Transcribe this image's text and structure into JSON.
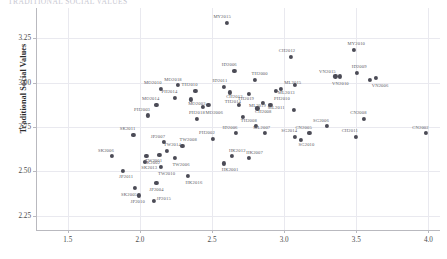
{
  "title_clipped": "TRADITIONAL SOCIAL VALUES",
  "axes": {
    "ylabel": "Traditional Social Values",
    "xlabel": "",
    "xticks": [
      "1.5",
      "2.0",
      "2.5",
      "3.0",
      "3.5",
      "4.0"
    ],
    "yticks": [
      "2.25",
      "2.50",
      "2.75",
      "3.00",
      "3.25"
    ]
  },
  "colors": {
    "marker": "#4b4b56",
    "grid": "#e9e9ef",
    "axis": "#b9b9bf"
  },
  "chart_data": {
    "type": "scatter",
    "title": "",
    "xlabel": "",
    "ylabel": "Traditional Social Values",
    "xlim": [
      1.28,
      4.08
    ],
    "ylim": [
      2.17,
      3.42
    ],
    "xticks": [
      1.5,
      2.0,
      2.5,
      3.0,
      3.5,
      4.0
    ],
    "yticks": [
      2.25,
      2.5,
      2.75,
      3.0,
      3.25
    ],
    "grid": true,
    "legend": "none",
    "points": [
      {
        "label": "MY2015",
        "x": 2.605,
        "y": 3.335
      },
      {
        "label": "MY2010",
        "x": 3.485,
        "y": 3.185
      },
      {
        "label": "CH2012",
        "x": 3.045,
        "y": 3.145
      },
      {
        "label": "ID2006",
        "x": 2.655,
        "y": 3.065
      },
      {
        "label": "VN2015",
        "x": 3.355,
        "y": 3.035
      },
      {
        "label": "VN2010",
        "x": 3.385,
        "y": 3.035
      },
      {
        "label": "ID2009",
        "x": 3.505,
        "y": 3.055
      },
      {
        "label": "TH2000",
        "x": 2.795,
        "y": 3.015
      },
      {
        "label": "ML2011",
        "x": 3.075,
        "y": 2.985
      },
      {
        "label": "VN2006",
        "x": 3.595,
        "y": 3.015
      },
      {
        "label": "VN2001",
        "x": 3.635,
        "y": 3.025
      },
      {
        "label": "MO2018",
        "x": 2.265,
        "y": 2.985
      },
      {
        "label": "ID2011",
        "x": 2.585,
        "y": 2.975
      },
      {
        "label": "MO2010",
        "x": 2.145,
        "y": 2.965
      },
      {
        "label": "TH2010",
        "x": 2.385,
        "y": 2.955
      },
      {
        "label": "CH2013",
        "x": 2.625,
        "y": 2.945
      },
      {
        "label": "TH2019",
        "x": 2.755,
        "y": 2.935
      },
      {
        "label": "PH2010",
        "x": 2.945,
        "y": 2.955
      },
      {
        "label": "ML2015",
        "x": 2.975,
        "y": 2.965
      },
      {
        "label": "PH2014",
        "x": 2.245,
        "y": 2.915
      },
      {
        "label": "MO2003",
        "x": 2.355,
        "y": 2.905
      },
      {
        "label": "MO2014",
        "x": 2.115,
        "y": 2.875
      },
      {
        "label": "ML2019",
        "x": 2.855,
        "y": 2.885
      },
      {
        "label": "TH2014",
        "x": 2.685,
        "y": 2.875
      },
      {
        "label": "PH2003",
        "x": 2.055,
        "y": 2.815
      },
      {
        "label": "ML2011b",
        "x": 2.905,
        "y": 2.875
      },
      {
        "label": "CH2008",
        "x": 2.815,
        "y": 2.855
      },
      {
        "label": "MO2006",
        "x": 2.475,
        "y": 2.875
      },
      {
        "label": "PH2018",
        "x": 2.435,
        "y": 2.865
      },
      {
        "label": "ML2013",
        "x": 3.065,
        "y": 2.845
      },
      {
        "label": "PH2010b",
        "x": 2.395,
        "y": 2.795
      },
      {
        "label": "TH2008",
        "x": 2.715,
        "y": 2.805
      },
      {
        "label": "CN2008",
        "x": 3.555,
        "y": 2.795
      },
      {
        "label": "SG2006",
        "x": 3.295,
        "y": 2.755
      },
      {
        "label": "ML2007",
        "x": 2.805,
        "y": 2.755
      },
      {
        "label": "SK2011",
        "x": 1.955,
        "y": 2.705
      },
      {
        "label": "ID2006b",
        "x": 2.665,
        "y": 2.715
      },
      {
        "label": "PH2002",
        "x": 2.505,
        "y": 2.685
      },
      {
        "label": "ML2007b",
        "x": 2.865,
        "y": 2.715
      },
      {
        "label": "SG2014",
        "x": 3.075,
        "y": 2.695
      },
      {
        "label": "CN2005",
        "x": 3.175,
        "y": 2.715
      },
      {
        "label": "CH2011",
        "x": 3.495,
        "y": 2.695
      },
      {
        "label": "CN2002",
        "x": 3.985,
        "y": 2.715
      },
      {
        "label": "JP2007",
        "x": 2.165,
        "y": 2.665
      },
      {
        "label": "TW2008",
        "x": 2.295,
        "y": 2.645
      },
      {
        "label": "SG2010",
        "x": 3.115,
        "y": 2.675
      },
      {
        "label": "TW2014",
        "x": 2.185,
        "y": 2.615
      },
      {
        "label": "SK2006",
        "x": 1.805,
        "y": 2.585
      },
      {
        "label": "TW2001",
        "x": 2.135,
        "y": 2.595
      },
      {
        "label": "SK2002",
        "x": 2.045,
        "y": 2.585
      },
      {
        "label": "TW2006",
        "x": 2.245,
        "y": 2.575
      },
      {
        "label": "HK2012",
        "x": 2.635,
        "y": 2.585
      },
      {
        "label": "SK2013",
        "x": 2.035,
        "y": 2.555
      },
      {
        "label": "HK2007",
        "x": 2.755,
        "y": 2.575
      },
      {
        "label": "HK2001",
        "x": 2.585,
        "y": 2.545
      },
      {
        "label": "TW2010",
        "x": 2.145,
        "y": 2.525
      },
      {
        "label": "JP2011",
        "x": 1.885,
        "y": 2.505
      },
      {
        "label": "HK2016",
        "x": 2.335,
        "y": 2.475
      },
      {
        "label": "JP2004",
        "x": 2.115,
        "y": 2.435
      },
      {
        "label": "JP2010",
        "x": 1.995,
        "y": 2.365
      },
      {
        "label": "SK2005",
        "x": 1.965,
        "y": 2.405
      },
      {
        "label": "JP2015",
        "x": 2.095,
        "y": 2.335
      }
    ]
  },
  "point_labels": [
    {
      "text": "MY2015",
      "x": 2.57,
      "y": 3.375
    },
    {
      "text": "MY2010",
      "x": 3.5,
      "y": 3.225
    },
    {
      "text": "CH2012",
      "x": 3.02,
      "y": 3.185
    },
    {
      "text": "ID2006",
      "x": 2.62,
      "y": 3.105
    },
    {
      "text": "VN2015",
      "x": 3.3,
      "y": 3.068
    },
    {
      "text": "VN2010",
      "x": 3.39,
      "y": 3.0
    },
    {
      "text": "ID2009",
      "x": 3.52,
      "y": 3.095
    },
    {
      "text": "TH2000",
      "x": 2.83,
      "y": 3.052
    },
    {
      "text": "ML2015",
      "x": 3.06,
      "y": 3.005
    },
    {
      "text": "VN2006",
      "x": 3.665,
      "y": 2.985
    },
    {
      "text": "MO2018",
      "x": 2.23,
      "y": 3.022
    },
    {
      "text": "ID2011",
      "x": 2.555,
      "y": 3.012
    },
    {
      "text": "MO2010",
      "x": 2.09,
      "y": 3.002
    },
    {
      "text": "TH2010",
      "x": 2.345,
      "y": 2.992
    },
    {
      "text": "CH2013",
      "x": 2.655,
      "y": 2.925
    },
    {
      "text": "TH2019",
      "x": 2.735,
      "y": 2.912
    },
    {
      "text": "PH2010",
      "x": 2.985,
      "y": 2.912
    },
    {
      "text": "ML2013",
      "x": 3.015,
      "y": 2.945
    },
    {
      "text": "PH2014",
      "x": 2.205,
      "y": 2.952
    },
    {
      "text": "MO2003",
      "x": 2.395,
      "y": 2.885
    },
    {
      "text": "MO2014",
      "x": 2.075,
      "y": 2.912
    },
    {
      "text": "ML2019",
      "x": 2.815,
      "y": 2.872
    },
    {
      "text": "TH2014",
      "x": 2.645,
      "y": 2.895
    },
    {
      "text": "PH2003",
      "x": 2.015,
      "y": 2.852
    },
    {
      "text": "ML2011",
      "x": 2.945,
      "y": 2.862
    },
    {
      "text": "CH2008",
      "x": 2.855,
      "y": 2.842
    },
    {
      "text": "MO2006",
      "x": 2.515,
      "y": 2.832
    },
    {
      "text": "PH2018",
      "x": 2.395,
      "y": 2.832
    },
    {
      "text": "TH2008",
      "x": 2.755,
      "y": 2.792
    },
    {
      "text": "CN2008",
      "x": 3.515,
      "y": 2.832
    },
    {
      "text": "SG2006",
      "x": 3.255,
      "y": 2.792
    },
    {
      "text": "ML2007",
      "x": 2.845,
      "y": 2.752
    },
    {
      "text": "SK2011",
      "x": 1.915,
      "y": 2.742
    },
    {
      "text": "ID2006b",
      "x": 2.625,
      "y": 2.752
    },
    {
      "text": "PH2002",
      "x": 2.465,
      "y": 2.722
    },
    {
      "text": "SG2014",
      "x": 3.035,
      "y": 2.732
    },
    {
      "text": "CN2005",
      "x": 3.135,
      "y": 2.752
    },
    {
      "text": "CH2011",
      "x": 3.455,
      "y": 2.732
    },
    {
      "text": "CN2002",
      "x": 3.945,
      "y": 2.752
    },
    {
      "text": "JP2007",
      "x": 2.125,
      "y": 2.702
    },
    {
      "text": "TW2008",
      "x": 2.335,
      "y": 2.682
    },
    {
      "text": "SG2010",
      "x": 3.155,
      "y": 2.652
    },
    {
      "text": "TW2014",
      "x": 2.225,
      "y": 2.652
    },
    {
      "text": "SK2006",
      "x": 1.765,
      "y": 2.622
    },
    {
      "text": "TW2001",
      "x": 2.095,
      "y": 2.562
    },
    {
      "text": "SK2002",
      "x": 2.085,
      "y": 2.552
    },
    {
      "text": "TW2006",
      "x": 2.285,
      "y": 2.542
    },
    {
      "text": "HK2012",
      "x": 2.675,
      "y": 2.622
    },
    {
      "text": "SK2013",
      "x": 2.065,
      "y": 2.522
    },
    {
      "text": "HK2007",
      "x": 2.795,
      "y": 2.612
    },
    {
      "text": "HK2001",
      "x": 2.625,
      "y": 2.512
    },
    {
      "text": "TW2010",
      "x": 2.185,
      "y": 2.492
    },
    {
      "text": "JP2011",
      "x": 1.905,
      "y": 2.472
    },
    {
      "text": "HK2016",
      "x": 2.375,
      "y": 2.442
    },
    {
      "text": "JP2004",
      "x": 2.115,
      "y": 2.402
    },
    {
      "text": "JP2010",
      "x": 1.985,
      "y": 2.332
    },
    {
      "text": "SK2005",
      "x": 1.925,
      "y": 2.372
    },
    {
      "text": "JP2015",
      "x": 2.165,
      "y": 2.352
    }
  ]
}
